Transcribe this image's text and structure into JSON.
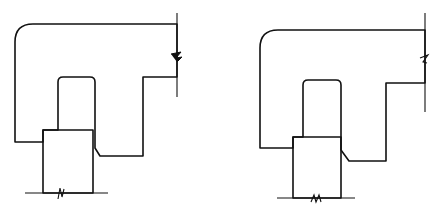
{
  "figure": {
    "colors": {
      "ink": "#111111",
      "paper": "#ffffff"
    },
    "panels": [
      {
        "id": "left",
        "body_hatch": "diagonal-45",
        "post_hatch": "diagonal-135",
        "break_symbols": [
          "right-vertical-break",
          "bottom-baseline-break"
        ]
      },
      {
        "id": "right",
        "body_hatch": "diagonal-45",
        "post_hatch": "diagonal-135",
        "break_symbols": [
          "right-vertical-break",
          "bottom-baseline-break"
        ]
      }
    ]
  }
}
